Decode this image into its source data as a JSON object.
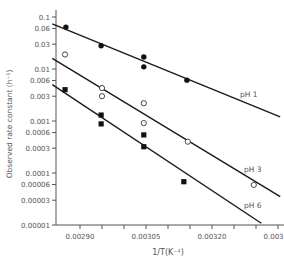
{
  "chart_data": {
    "type": "scatter",
    "title": "",
    "xlabel": "1/T(K⁻¹)",
    "ylabel": "Observed rate constant (h⁻¹)",
    "yscale": "log",
    "xlim": [
      0.0029,
      0.003365
    ],
    "ylim": [
      1e-05,
      0.1
    ],
    "x_ticks": [
      0.0029,
      0.00295,
      0.003,
      0.00305,
      0.0031,
      0.00315,
      0.0032,
      0.00325,
      0.0033,
      0.00335
    ],
    "x_tick_labels": [
      {
        "value": 0.0029,
        "label": "0.00290"
      },
      {
        "value": 0.00305,
        "label": "0.00305"
      },
      {
        "value": 0.0032,
        "label": "0.00320"
      },
      {
        "value": 0.00335,
        "label": "0.00335"
      }
    ],
    "y_ticks": [
      {
        "value": 0.1,
        "label": "0.1"
      },
      {
        "value": 0.06,
        "label": "0.06"
      },
      {
        "value": 0.03,
        "label": "0.03"
      },
      {
        "value": 0.01,
        "label": "0.01"
      },
      {
        "value": 0.006,
        "label": "0.006"
      },
      {
        "value": 0.003,
        "label": "0.003"
      },
      {
        "value": 0.001,
        "label": "0.001"
      },
      {
        "value": 0.0006,
        "label": "0.0006"
      },
      {
        "value": 0.0003,
        "label": "0.0003"
      },
      {
        "value": 0.0001,
        "label": "0.0001"
      },
      {
        "value": 6e-05,
        "label": "0.00006"
      },
      {
        "value": 3e-05,
        "label": "0.00003"
      },
      {
        "value": 1e-05,
        "label": "0.00001"
      }
    ],
    "grid": false,
    "legend": "inline labels at right end of fitted lines",
    "series": [
      {
        "name": "pH 1",
        "marker": "filled-circle",
        "points": [
          {
            "x": 0.002868,
            "y": 0.064
          },
          {
            "x": 0.002948,
            "y": 0.028
          },
          {
            "x": 0.003045,
            "y": 0.017
          },
          {
            "x": 0.003045,
            "y": 0.011
          },
          {
            "x": 0.003143,
            "y": 0.0061
          }
        ],
        "fit_line": [
          {
            "x": 0.002837,
            "y": 0.074
          },
          {
            "x": 0.003355,
            "y": 0.0012
          }
        ],
        "label_pos": {
          "x": 240,
          "y": 97
        }
      },
      {
        "name": "pH 3",
        "marker": "open-circle",
        "points": [
          {
            "x": 0.002866,
            "y": 0.019
          },
          {
            "x": 0.00295,
            "y": 0.0043
          },
          {
            "x": 0.00295,
            "y": 0.003
          },
          {
            "x": 0.003045,
            "y": 0.0022
          },
          {
            "x": 0.003045,
            "y": 0.00091
          },
          {
            "x": 0.003145,
            "y": 0.0004
          },
          {
            "x": 0.003295,
            "y": 5.9e-05
          }
        ],
        "fit_line": [
          {
            "x": 0.002837,
            "y": 0.016
          },
          {
            "x": 0.003355,
            "y": 3.5e-05
          }
        ],
        "label_pos": {
          "x": 244,
          "y": 172
        }
      },
      {
        "name": "pH 6",
        "marker": "filled-square",
        "points": [
          {
            "x": 0.002866,
            "y": 0.004
          },
          {
            "x": 0.002948,
            "y": 0.0013
          },
          {
            "x": 0.002948,
            "y": 0.00088
          },
          {
            "x": 0.003045,
            "y": 0.00054
          },
          {
            "x": 0.003045,
            "y": 0.00032
          },
          {
            "x": 0.003136,
            "y": 6.8e-05
          }
        ],
        "fit_line": [
          {
            "x": 0.002837,
            "y": 0.005
          },
          {
            "x": 0.003312,
            "y": 1.08e-05
          }
        ],
        "label_pos": {
          "x": 244,
          "y": 208
        }
      }
    ]
  }
}
